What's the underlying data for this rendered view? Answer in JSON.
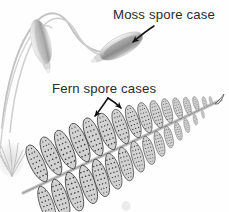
{
  "figure": {
    "background_color": "#fefefe",
    "width": 229,
    "height": 212
  },
  "labels": [
    {
      "id": "moss-spore-case",
      "text": "Moss spore case",
      "x": 113,
      "y": 19,
      "color": "#2b2b2b"
    },
    {
      "id": "fern-spore-cases",
      "text": "Fern spore cases",
      "x": 52,
      "y": 93,
      "color": "#2b2b2b"
    }
  ],
  "annotations": {
    "moss_arrow": {
      "name": "moss-spore-case-arrow",
      "color": "#111111",
      "points_to": "right moss capsule"
    },
    "fern_arrow_left": {
      "name": "fern-spore-cases-arrow-left",
      "color": "#111111",
      "points_to": "left pinna sori"
    },
    "fern_arrow_right": {
      "name": "fern-spore-cases-arrow-right",
      "color": "#111111",
      "points_to": "right pinna sori"
    }
  },
  "illustration": {
    "moss": {
      "name": "moss-plant",
      "capsule_fill_light": "#e8e8e8",
      "capsule_fill_dark": "#8d8d8d",
      "seta_color": "#b9b9b9",
      "capsules": [
        {
          "name": "moss-capsule-left",
          "cx": 41,
          "cy": 42,
          "rx": 9,
          "ry": 23,
          "rotate": -16
        },
        {
          "name": "moss-capsule-right",
          "cx": 122,
          "cy": 47,
          "rx": 9,
          "ry": 25,
          "rotate": 62
        }
      ],
      "tuft": {
        "name": "moss-tuft",
        "x": 10,
        "y": 155,
        "color": "#c9c9c9"
      }
    },
    "fern": {
      "name": "fern-frond",
      "pinna_fill": "#d2d2d2",
      "pinna_stroke": "#4a4a4a",
      "rachis_color": "#bdbdbd",
      "sori_color": "#3a3a3a",
      "pinna_count_upper": 14,
      "pinna_count_lower": 13,
      "rachis_start": {
        "x": 23,
        "y": 192
      },
      "rachis_end": {
        "x": 221,
        "y": 100
      }
    },
    "smudge": {
      "name": "page-smudge",
      "x": 126,
      "y": 205,
      "color": "#e0e0e0"
    }
  }
}
